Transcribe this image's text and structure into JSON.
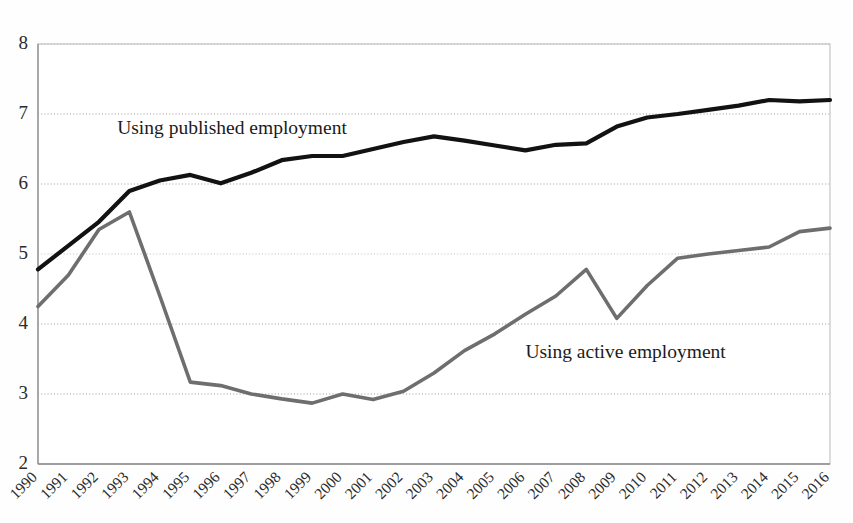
{
  "chart_data": {
    "type": "line",
    "title": "",
    "xlabel": "",
    "ylabel": "",
    "x": [
      1990,
      1991,
      1992,
      1993,
      1994,
      1995,
      1996,
      1997,
      1998,
      1999,
      2000,
      2001,
      2002,
      2003,
      2004,
      2005,
      2006,
      2007,
      2008,
      2009,
      2010,
      2011,
      2012,
      2013,
      2014,
      2015,
      2016
    ],
    "categories": [
      "1990",
      "1991",
      "1992",
      "1993",
      "1994",
      "1995",
      "1996",
      "1997",
      "1998",
      "1999",
      "2000",
      "2001",
      "2002",
      "2003",
      "2004",
      "2005",
      "2006",
      "2007",
      "2008",
      "2009",
      "2010",
      "2011",
      "2012",
      "2013",
      "2014",
      "2015",
      "2016"
    ],
    "series": [
      {
        "name": "Using published employment",
        "color": "#121212",
        "line_width": 4.2,
        "values": [
          4.78,
          5.12,
          5.46,
          5.9,
          6.05,
          6.13,
          6.01,
          6.16,
          6.34,
          6.4,
          6.4,
          6.5,
          6.6,
          6.68,
          6.62,
          6.55,
          6.48,
          6.56,
          6.58,
          6.82,
          6.95,
          7.0,
          7.06,
          7.12,
          7.2,
          7.18,
          7.2
        ],
        "label_text": "Using published employment",
        "label_x": 1992.6,
        "label_y": 6.72
      },
      {
        "name": "Using active employment",
        "color": "#6e6e6e",
        "line_width": 3.6,
        "values": [
          4.25,
          4.7,
          5.35,
          5.6,
          4.4,
          3.17,
          3.12,
          3.0,
          2.93,
          2.87,
          3.0,
          2.92,
          3.04,
          3.3,
          3.62,
          3.86,
          4.14,
          4.4,
          4.78,
          4.08,
          4.55,
          4.94,
          5.0,
          5.05,
          5.1,
          5.32,
          5.37
        ],
        "label_text": "Using active employment",
        "label_x": 2006.0,
        "label_y": 3.52
      }
    ],
    "xlim": [
      1990,
      2016
    ],
    "ylim": [
      2,
      8
    ],
    "yticks": [
      2,
      3,
      4,
      5,
      6,
      7,
      8
    ],
    "ytick_labels": [
      "2",
      "3",
      "4",
      "5",
      "6",
      "7",
      "8"
    ],
    "grid": true,
    "grid_color": "#9a9a9a",
    "legend_position": "inline-annotations",
    "xtick_rotation": 45,
    "background_color": "#fefefe"
  }
}
